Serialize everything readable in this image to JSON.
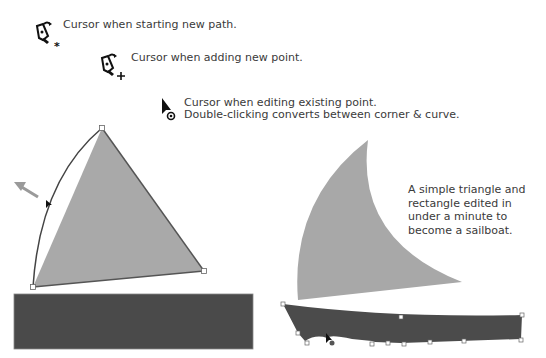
{
  "cursors": [
    {
      "icon": "pen-new-path-cursor-icon",
      "label": "Cursor when starting new path."
    },
    {
      "icon": "pen-add-point-cursor-icon",
      "label": "Cursor when adding new point."
    },
    {
      "icon": "edit-point-cursor-icon",
      "label": "Cursor when editing existing point.",
      "label2": "Double-clicking converts between corner & curve."
    }
  ],
  "note": {
    "line1": "A simple triangle and",
    "line2": "rectangle edited in",
    "line3": "under a minute to",
    "line4": "become a sailboat."
  },
  "colors": {
    "sail_fill": "#a8a8a8",
    "hull_fill": "#4a4a4a",
    "outline": "#555555",
    "text": "#3a3a3a"
  }
}
